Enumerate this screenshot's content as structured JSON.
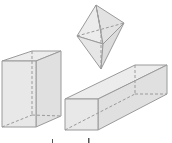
{
  "figure": {
    "colors": {
      "face": "#e9e9e9",
      "face_dark": "#dcdcdc",
      "edge": "#9a9a9a",
      "hidden_edge": "#9a9a9a"
    },
    "shapes": [
      {
        "name": "octahedron",
        "label": ""
      },
      {
        "name": "tall-rectangular-prism",
        "label": ""
      },
      {
        "name": "long-rectangular-prism",
        "label": ""
      }
    ],
    "captions": [
      "",
      ""
    ]
  }
}
